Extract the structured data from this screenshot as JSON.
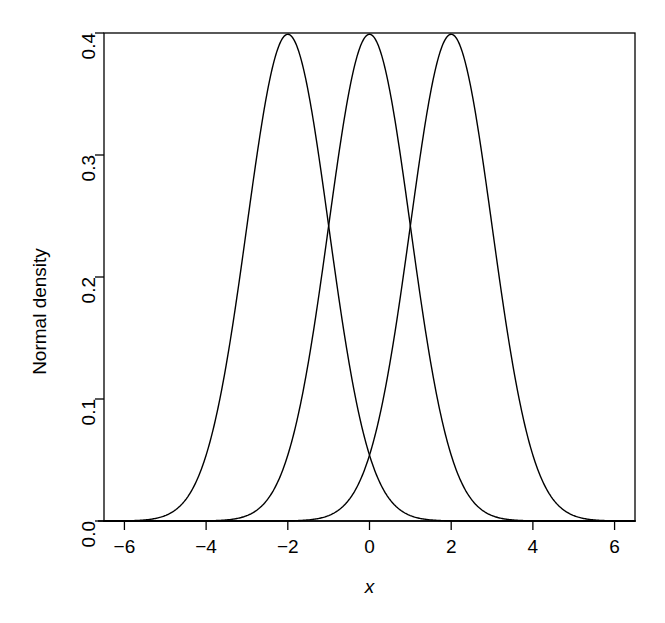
{
  "chart_data": {
    "type": "line",
    "title": "",
    "subtitle": "",
    "xlabel": "x",
    "ylabel": "Normal density",
    "xlim": [
      -6.5,
      6.5
    ],
    "ylim": [
      0.0,
      0.4
    ],
    "grid": false,
    "legend": false,
    "legend_position": "none",
    "xticks": [
      -6,
      -4,
      -2,
      0,
      2,
      4,
      6
    ],
    "xtick_labels": [
      "−6",
      "−4",
      "−2",
      "0",
      "2",
      "4",
      "6"
    ],
    "yticks": [
      0.0,
      0.1,
      0.2,
      0.3,
      0.4
    ],
    "ytick_labels": [
      "0.0",
      "0.1",
      "0.2",
      "0.3",
      "0.4"
    ],
    "line_color": "#000000",
    "line_width": 1.4,
    "background_color": "#ffffff",
    "box": true,
    "annotations": [
      {
        "name": "baseline",
        "type": "hline",
        "y": 0.0
      }
    ],
    "series": [
      {
        "name": "Normal(mean = -2, sd = 1)",
        "mean": -2,
        "sd": 1,
        "peak_x": -2,
        "peak_y": 0.399,
        "x": [
          -6.5,
          -6.0,
          -5.5,
          -5.0,
          -4.5,
          -4.0,
          -3.5,
          -3.0,
          -2.5,
          -2.0,
          -1.5,
          -1.0,
          -0.5,
          0.0,
          0.5,
          1.0,
          1.5,
          2.0,
          2.5,
          3.0,
          3.5,
          4.0,
          4.5,
          5.0,
          5.5,
          6.0,
          6.5
        ],
        "values": [
          0.0,
          0.0,
          0.0,
          0.004,
          0.018,
          0.054,
          0.13,
          0.242,
          0.352,
          0.399,
          0.352,
          0.242,
          0.13,
          0.054,
          0.018,
          0.004,
          0.001,
          0.0,
          0.0,
          0.0,
          0.0,
          0.0,
          0.0,
          0.0,
          0.0,
          0.0,
          0.0
        ]
      },
      {
        "name": "Normal(mean = 0, sd = 1)",
        "mean": 0,
        "sd": 1,
        "peak_x": 0,
        "peak_y": 0.399,
        "x": [
          -6.5,
          -6.0,
          -5.5,
          -5.0,
          -4.5,
          -4.0,
          -3.5,
          -3.0,
          -2.5,
          -2.0,
          -1.5,
          -1.0,
          -0.5,
          0.0,
          0.5,
          1.0,
          1.5,
          2.0,
          2.5,
          3.0,
          3.5,
          4.0,
          4.5,
          5.0,
          5.5,
          6.0,
          6.5
        ],
        "values": [
          0.0,
          0.0,
          0.0,
          0.0,
          0.0,
          0.0,
          0.001,
          0.004,
          0.018,
          0.054,
          0.13,
          0.242,
          0.352,
          0.399,
          0.352,
          0.242,
          0.13,
          0.054,
          0.018,
          0.004,
          0.001,
          0.0,
          0.0,
          0.0,
          0.0,
          0.0,
          0.0
        ]
      },
      {
        "name": "Normal(mean = 2, sd = 1)",
        "mean": 2,
        "sd": 1,
        "peak_x": 2,
        "peak_y": 0.399,
        "x": [
          -6.5,
          -6.0,
          -5.5,
          -5.0,
          -4.5,
          -4.0,
          -3.5,
          -3.0,
          -2.5,
          -2.0,
          -1.5,
          -1.0,
          -0.5,
          0.0,
          0.5,
          1.0,
          1.5,
          2.0,
          2.5,
          3.0,
          3.5,
          4.0,
          4.5,
          5.0,
          5.5,
          6.0,
          6.5
        ],
        "values": [
          0.0,
          0.0,
          0.0,
          0.0,
          0.0,
          0.0,
          0.0,
          0.0,
          0.0,
          0.0,
          0.001,
          0.004,
          0.018,
          0.054,
          0.13,
          0.242,
          0.352,
          0.399,
          0.352,
          0.242,
          0.13,
          0.054,
          0.018,
          0.004,
          0.0,
          0.0,
          0.0
        ]
      }
    ],
    "intersections": [
      {
        "x": -1,
        "y": 0.242
      },
      {
        "x": 1,
        "y": 0.242
      },
      {
        "x": 0,
        "y": 0.054
      }
    ]
  }
}
